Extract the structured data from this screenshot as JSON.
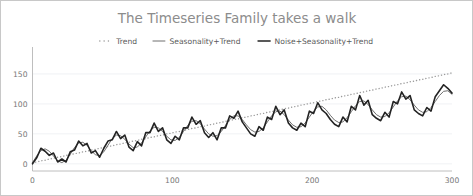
{
  "chart_data": {
    "type": "line",
    "title": "The Timeseries Family takes a walk",
    "xlabel": "",
    "ylabel": "",
    "xlim": [
      0,
      300
    ],
    "ylim": [
      -12,
      185
    ],
    "xticks": [
      0,
      100,
      200,
      300
    ],
    "xtick_labels": [
      "0",
      "100",
      "200",
      "300"
    ],
    "yticks": [
      0,
      50,
      100,
      150
    ],
    "ytick_labels": [
      "0",
      "50",
      "100",
      "150"
    ],
    "grid": true,
    "grid_axis": "y",
    "legend_position": "top-center",
    "legend": [
      {
        "label": "Trend",
        "style": "dotted",
        "color": "#9a9a9a",
        "width": 1.4
      },
      {
        "label": "Seasonality+Trend",
        "style": "solid",
        "color": "#6e6e6e",
        "width": 1.0
      },
      {
        "label": "Noise+Seasonality+Trend",
        "style": "solid",
        "color": "#232323",
        "width": 1.6
      }
    ],
    "x": [
      0,
      3,
      6,
      9,
      12,
      15,
      18,
      21,
      24,
      27,
      30,
      33,
      36,
      39,
      42,
      45,
      48,
      51,
      54,
      57,
      60,
      63,
      66,
      69,
      72,
      75,
      78,
      81,
      84,
      87,
      90,
      93,
      96,
      99,
      102,
      105,
      108,
      111,
      114,
      117,
      120,
      123,
      126,
      129,
      132,
      135,
      138,
      141,
      144,
      147,
      150,
      153,
      156,
      159,
      162,
      165,
      168,
      171,
      174,
      177,
      180,
      183,
      186,
      189,
      192,
      195,
      198,
      201,
      204,
      207,
      210,
      213,
      216,
      219,
      222,
      225,
      228,
      231,
      234,
      237,
      240,
      243,
      246,
      249,
      252,
      255,
      258,
      261,
      264,
      267,
      270,
      273,
      276,
      279,
      282,
      285,
      288,
      291,
      294,
      297,
      300
    ],
    "series": [
      {
        "name": "Trend",
        "style": "dotted",
        "color": "#9a9a9a",
        "width": 1.4,
        "values": [
          2,
          3,
          5,
          6,
          8,
          9,
          11,
          12,
          14,
          15,
          17,
          18,
          20,
          21,
          23,
          24,
          26,
          27,
          29,
          30,
          32,
          33,
          35,
          36,
          38,
          39,
          41,
          42,
          44,
          45,
          47,
          48,
          50,
          51,
          53,
          54,
          56,
          57,
          59,
          60,
          62,
          63,
          65,
          66,
          68,
          69,
          71,
          72,
          74,
          75,
          77,
          78,
          80,
          81,
          83,
          84,
          86,
          87,
          89,
          90,
          92,
          93,
          95,
          96,
          98,
          99,
          101,
          102,
          104,
          105,
          107,
          108,
          110,
          111,
          113,
          114,
          116,
          117,
          119,
          120,
          122,
          123,
          125,
          126,
          128,
          129,
          131,
          132,
          134,
          135,
          137,
          138,
          140,
          141,
          143,
          144,
          146,
          147,
          149,
          150,
          152
        ]
      },
      {
        "name": "Seasonality+Trend",
        "style": "solid",
        "color": "#6e6e6e",
        "width": 1.0,
        "values": [
          2,
          13,
          22,
          25,
          21,
          13,
          5,
          2,
          6,
          16,
          27,
          35,
          36,
          31,
          22,
          15,
          14,
          20,
          31,
          42,
          48,
          47,
          41,
          33,
          27,
          28,
          35,
          45,
          55,
          61,
          60,
          54,
          46,
          40,
          39,
          44,
          54,
          64,
          71,
          72,
          67,
          58,
          50,
          46,
          47,
          54,
          64,
          74,
          80,
          80,
          74,
          65,
          57,
          53,
          54,
          60,
          70,
          80,
          87,
          88,
          82,
          73,
          65,
          61,
          62,
          68,
          78,
          88,
          95,
          96,
          90,
          81,
          73,
          69,
          70,
          77,
          87,
          97,
          104,
          105,
          99,
          90,
          82,
          78,
          79,
          85,
          95,
          105,
          112,
          113,
          107,
          98,
          90,
          86,
          87,
          94,
          104,
          114,
          121,
          122,
          116
        ]
      },
      {
        "name": "Noise+Seasonality+Trend",
        "style": "solid",
        "color": "#232323",
        "width": 1.6,
        "values": [
          0,
          10,
          26,
          21,
          14,
          18,
          3,
          8,
          3,
          20,
          23,
          38,
          30,
          34,
          18,
          22,
          11,
          26,
          38,
          40,
          54,
          42,
          48,
          28,
          22,
          37,
          30,
          52,
          52,
          68,
          54,
          60,
          40,
          34,
          46,
          40,
          60,
          60,
          78,
          66,
          72,
          52,
          44,
          52,
          40,
          60,
          60,
          80,
          76,
          88,
          70,
          60,
          50,
          46,
          62,
          56,
          78,
          74,
          96,
          82,
          90,
          68,
          60,
          56,
          68,
          62,
          88,
          84,
          102,
          90,
          84,
          74,
          66,
          62,
          78,
          70,
          96,
          90,
          114,
          98,
          106,
          82,
          76,
          72,
          86,
          78,
          104,
          100,
          120,
          108,
          114,
          90,
          84,
          80,
          94,
          88,
          112,
          122,
          132,
          126,
          118
        ]
      }
    ]
  },
  "axis": {
    "y_tick_labels": [
      "150",
      "100",
      "50",
      "0"
    ],
    "x_tick_labels": [
      "0",
      "100",
      "200",
      "300"
    ]
  }
}
